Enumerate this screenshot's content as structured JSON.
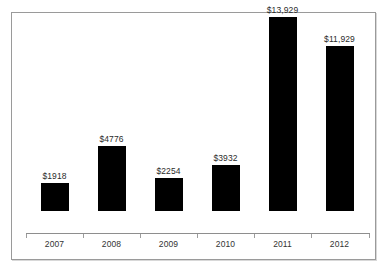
{
  "chart_data": {
    "type": "bar",
    "title": "",
    "subtitle": "",
    "xlabel": "",
    "ylabel": "",
    "categories": [
      "2007",
      "2008",
      "2009",
      "2010",
      "2011",
      "2012"
    ],
    "values": [
      1918,
      4776,
      2254,
      3932,
      13929,
      11929
    ],
    "value_labels": [
      "$1918",
      "$4776",
      "$2254",
      "$3932",
      "$13,929",
      "$11,929"
    ],
    "series": [
      {
        "name": "",
        "values": [
          1918,
          4776,
          2254,
          3932,
          13929,
          11929
        ]
      }
    ],
    "ylim": [
      0,
      15500
    ],
    "grid": false,
    "legend": null,
    "legend_position": "none",
    "annotations": [],
    "bar_color": "#000000",
    "axis_color": "#8e8e8e",
    "label_color": "#2b2b2b",
    "frame_color": "#9a9a9a",
    "background_color": "#ffffff"
  },
  "bars": [
    {
      "category": "2007",
      "value": 1918,
      "label": "$1918",
      "bar_height_px": 28,
      "left_px": 14
    },
    {
      "category": "2008",
      "value": 4776,
      "label": "$4776",
      "bar_height_px": 65,
      "left_px": 71
    },
    {
      "category": "2009",
      "value": 2254,
      "label": "$2254",
      "bar_height_px": 33,
      "left_px": 128
    },
    {
      "category": "2010",
      "value": 3932,
      "label": "$3932",
      "bar_height_px": 46,
      "left_px": 185
    },
    {
      "category": "2011",
      "value": 13929,
      "label": "$13,929",
      "bar_height_px": 194,
      "left_px": 242
    },
    {
      "category": "2012",
      "value": 11929,
      "label": "$11,929",
      "bar_height_px": 165,
      "left_px": 299
    }
  ],
  "ticks": [
    {
      "left_px": 14
    },
    {
      "left_px": 71
    },
    {
      "left_px": 128
    },
    {
      "left_px": 185
    },
    {
      "left_px": 242
    },
    {
      "left_px": 299
    },
    {
      "left_px": 357
    }
  ]
}
